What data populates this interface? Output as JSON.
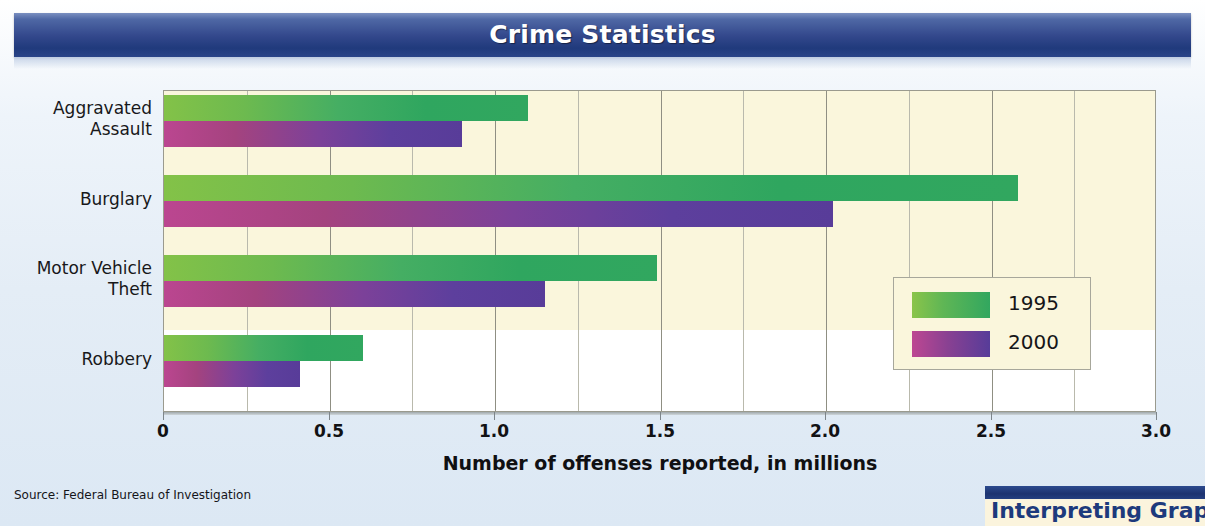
{
  "banner": {
    "title": "Crime Statistics"
  },
  "source_note": "Source: Federal Bureau of Investigation",
  "callout": {
    "text": "Interpreting Graphs"
  },
  "legend": {
    "items": [
      {
        "label": "1995",
        "color": "#35a860"
      },
      {
        "label": "2000",
        "color": "#5b3f9e"
      }
    ]
  },
  "axis": {
    "title": "Number of offenses reported, in millions",
    "ticks": [
      "0",
      "0.5",
      "1.0",
      "1.5",
      "2.0",
      "2.5",
      "3.0"
    ]
  },
  "categories": [
    {
      "line1": "Aggravated",
      "line2": "Assault"
    },
    {
      "line1": "Burglary",
      "line2": ""
    },
    {
      "line1": "Motor Vehicle",
      "line2": "Theft"
    },
    {
      "line1": "Robbery",
      "line2": ""
    }
  ],
  "colors": {
    "page_background": "#e4edf6",
    "plot_background": "#faf6dc",
    "banner_dark": "#203a7c",
    "banner_light": "#7a8fc0",
    "series_1995_start": "#7cc043",
    "series_1995_end": "#35a860",
    "series_2000_start": "#b8458c",
    "series_2000_end": "#5b3f9e",
    "gridline": "#b9b9ac"
  },
  "chart_data": {
    "type": "bar",
    "orientation": "horizontal",
    "title": "Crime Statistics",
    "xlabel": "Number of offenses reported, in millions",
    "ylabel": "",
    "xlim": [
      0,
      3.0
    ],
    "xticks": [
      0,
      0.5,
      1.0,
      1.5,
      2.0,
      2.5,
      3.0
    ],
    "minor_gridline_step": 0.25,
    "grid": true,
    "legend_position": "lower right",
    "categories": [
      "Aggravated Assault",
      "Burglary",
      "Motor Vehicle Theft",
      "Robbery"
    ],
    "series": [
      {
        "name": "1995",
        "color": "#35a860",
        "values": [
          1.1,
          2.58,
          1.49,
          0.6
        ]
      },
      {
        "name": "2000",
        "color": "#5b3f9e",
        "values": [
          0.9,
          2.02,
          1.15,
          0.41
        ]
      }
    ],
    "source": "Source: Federal Bureau of Investigation"
  }
}
